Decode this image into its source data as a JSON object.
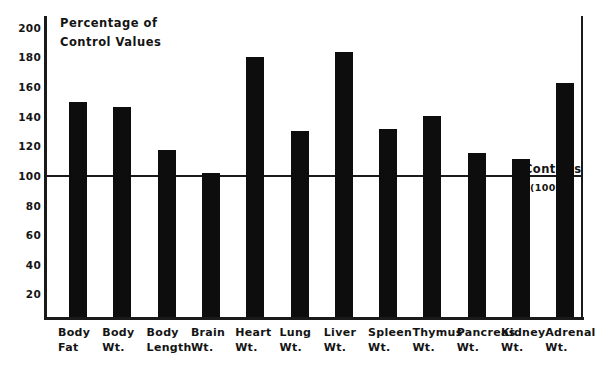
{
  "chart_data": {
    "type": "bar",
    "title": "",
    "ylabel_line1": "Percentage of",
    "ylabel_line2": "Control Values",
    "xlabel": "",
    "ylim": [
      0,
      200
    ],
    "yticks": [
      200,
      180,
      160,
      140,
      120,
      100,
      80,
      60,
      40,
      20
    ],
    "grid": false,
    "legend": "none",
    "reference_line": {
      "value": 100,
      "label_line1": "Controls",
      "label_line2": "(100%)"
    },
    "categories": [
      "Body Fat",
      "Body Wt.",
      "Body Length",
      "Brain Wt.",
      "Heart Wt.",
      "Lung Wt.",
      "Liver Wt.",
      "Spleen Wt.",
      "Thymus Wt.",
      "Pancreas Wt.",
      "Kidney Wt.",
      "Adrenal Wt."
    ],
    "category_lines": [
      {
        "l1": "Body",
        "l2": "Fat"
      },
      {
        "l1": "Body",
        "l2": "Wt."
      },
      {
        "l1": "Body",
        "l2": "Length"
      },
      {
        "l1": "Brain",
        "l2": "Wt."
      },
      {
        "l1": "Heart",
        "l2": "Wt."
      },
      {
        "l1": "Lung",
        "l2": "Wt."
      },
      {
        "l1": "Liver",
        "l2": "Wt."
      },
      {
        "l1": "Spleen",
        "l2": "Wt."
      },
      {
        "l1": "Thymus",
        "l2": "Wt."
      },
      {
        "l1": "Pancreas",
        "l2": "Wt."
      },
      {
        "l1": "Kidney",
        "l2": "Wt."
      },
      {
        "l1": "Adrenal",
        "l2": "Wt."
      }
    ],
    "values": [
      145,
      142,
      113,
      97,
      176,
      126,
      179,
      127,
      136,
      111,
      107,
      158
    ],
    "bar_color": "#0d0d0d",
    "axis_color": "#1a1a1a",
    "background_color": "#ffffff"
  }
}
